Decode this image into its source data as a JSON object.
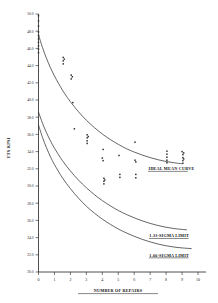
{
  "chart_data": {
    "type": "scatter",
    "title": "",
    "xlabel": "NUMBER OF REPAIRS",
    "ylabel": "UTS KPSI",
    "xlim": [
      0,
      10.5
    ],
    "ylim": [
      20.0,
      50.0
    ],
    "grid": false,
    "legend_position": "inline-annotations",
    "xticks": [
      0,
      1,
      2,
      3,
      4,
      5,
      6,
      7,
      8,
      9,
      10
    ],
    "xtick_labels": [
      "0",
      "1",
      "2",
      "3",
      "4",
      "5",
      "6",
      "7",
      "8",
      "9",
      "10"
    ],
    "yticks": [
      50.0,
      48.0,
      46.0,
      44.0,
      42.0,
      40.0,
      38.0,
      36.0,
      34.0,
      32.0,
      30.0,
      28.0,
      26.0,
      24.0,
      22.0,
      20.0
    ],
    "ytick_labels": [
      "50.0",
      "48.0",
      "46.0",
      "44.0",
      "42.0",
      "40.0",
      "38.0",
      "36.0",
      "34.0",
      "32.0",
      "30.0",
      "28.0",
      "26.0",
      "24.0",
      "22.0",
      "20.0"
    ],
    "series": [
      {
        "name": "IDEAL MEAN CURVE",
        "type": "line",
        "points": [
          [
            0.0,
            47.6
          ],
          [
            0.25,
            46.1
          ],
          [
            0.5,
            44.85
          ],
          [
            0.75,
            43.75
          ],
          [
            1.0,
            42.8
          ],
          [
            1.25,
            41.95
          ],
          [
            1.5,
            41.15
          ],
          [
            1.75,
            40.45
          ],
          [
            2.0,
            39.8
          ],
          [
            2.5,
            38.65
          ],
          [
            3.0,
            37.65
          ],
          [
            3.5,
            36.8
          ],
          [
            4.0,
            36.05
          ],
          [
            4.5,
            35.4
          ],
          [
            5.0,
            34.85
          ],
          [
            5.5,
            34.35
          ],
          [
            6.0,
            33.95
          ],
          [
            6.5,
            33.6
          ],
          [
            7.0,
            33.3
          ],
          [
            7.5,
            33.05
          ],
          [
            8.0,
            32.85
          ],
          [
            8.5,
            32.7
          ],
          [
            9.0,
            32.58
          ]
        ]
      },
      {
        "name": "1.33-SIGMA LIMIT",
        "type": "line",
        "points": [
          [
            0.0,
            38.6
          ],
          [
            0.25,
            37.3
          ],
          [
            0.5,
            36.2
          ],
          [
            0.75,
            35.25
          ],
          [
            1.0,
            34.4
          ],
          [
            1.5,
            32.95
          ],
          [
            2.0,
            31.75
          ],
          [
            2.5,
            30.7
          ],
          [
            3.0,
            29.8
          ],
          [
            3.5,
            29.0
          ],
          [
            4.0,
            28.3
          ],
          [
            4.5,
            27.7
          ],
          [
            5.0,
            27.15
          ],
          [
            5.5,
            26.7
          ],
          [
            6.0,
            26.3
          ],
          [
            6.5,
            25.95
          ],
          [
            7.0,
            25.65
          ],
          [
            7.5,
            25.4
          ],
          [
            8.0,
            25.2
          ],
          [
            8.5,
            25.05
          ],
          [
            9.0,
            24.95
          ],
          [
            9.3,
            24.9
          ]
        ]
      },
      {
        "name": "1.66-SIGMA LIMIT",
        "type": "line",
        "points": [
          [
            0.0,
            37.1
          ],
          [
            0.25,
            35.65
          ],
          [
            0.5,
            34.45
          ],
          [
            0.75,
            33.4
          ],
          [
            1.0,
            32.5
          ],
          [
            1.5,
            30.95
          ],
          [
            2.0,
            29.7
          ],
          [
            2.5,
            28.6
          ],
          [
            3.0,
            27.65
          ],
          [
            3.5,
            26.85
          ],
          [
            4.0,
            26.15
          ],
          [
            4.5,
            25.55
          ],
          [
            5.0,
            25.0
          ],
          [
            5.5,
            24.55
          ],
          [
            6.0,
            24.15
          ],
          [
            6.5,
            23.8
          ],
          [
            7.0,
            23.5
          ],
          [
            7.5,
            23.25
          ],
          [
            8.0,
            23.05
          ],
          [
            8.5,
            22.9
          ],
          [
            9.0,
            22.8
          ],
          [
            9.6,
            22.72
          ]
        ]
      },
      {
        "name": "measured specimens",
        "type": "scatter",
        "points": [
          [
            0.0,
            49.8
          ],
          [
            0.0,
            49.2
          ],
          [
            0.0,
            48.6
          ],
          [
            0.0,
            47.9
          ],
          [
            0.0,
            47.5
          ],
          [
            0.0,
            47.1
          ],
          [
            0.0,
            46.7
          ],
          [
            0.0,
            46.3
          ],
          [
            0.0,
            45.9
          ],
          [
            0.0,
            45.5
          ],
          [
            1.55,
            44.95
          ],
          [
            1.55,
            44.55
          ],
          [
            1.55,
            44.2
          ],
          [
            1.62,
            44.75
          ],
          [
            2.05,
            42.9
          ],
          [
            2.05,
            42.45
          ],
          [
            2.12,
            42.7
          ],
          [
            2.15,
            39.7
          ],
          [
            2.25,
            36.65
          ],
          [
            3.05,
            35.95
          ],
          [
            3.05,
            35.6
          ],
          [
            3.05,
            35.25
          ],
          [
            3.05,
            34.95
          ],
          [
            3.12,
            35.75
          ],
          [
            4.05,
            34.25
          ],
          [
            4.0,
            33.25
          ],
          [
            4.05,
            32.95
          ],
          [
            4.1,
            30.9
          ],
          [
            4.1,
            30.55
          ],
          [
            4.1,
            30.25
          ],
          [
            4.15,
            30.7
          ],
          [
            5.05,
            33.55
          ],
          [
            5.1,
            31.35
          ],
          [
            5.1,
            31.0
          ],
          [
            6.05,
            35.1
          ],
          [
            6.05,
            33.0
          ],
          [
            6.1,
            32.8
          ],
          [
            6.1,
            31.35
          ],
          [
            6.1,
            30.95
          ],
          [
            8.05,
            34.05
          ],
          [
            8.05,
            33.7
          ],
          [
            8.05,
            33.35
          ],
          [
            8.05,
            33.0
          ],
          [
            8.05,
            32.7
          ],
          [
            9.0,
            34.0
          ],
          [
            9.05,
            33.65
          ],
          [
            9.05,
            33.3
          ],
          [
            9.05,
            32.95
          ],
          [
            9.05,
            32.65
          ],
          [
            9.1,
            33.85
          ],
          [
            9.1,
            33.15
          ]
        ]
      }
    ],
    "annotations": [
      {
        "text": "IDEAL MEAN CURVE",
        "x": 6.9,
        "y": 31.85
      },
      {
        "text": "1.33-SIGMA LIMIT",
        "x": 6.95,
        "y": 24.05
      },
      {
        "text": "1.66-SIGMA LIMIT",
        "x": 6.95,
        "y": 21.8
      }
    ]
  },
  "figure": {
    "xlabel": "NUMBER OF REPAIRS",
    "ylabel": "UTS KPSI",
    "annotation_mean": "IDEAL MEAN CURVE",
    "annotation_sigma133": "1.33-SIGMA LIMIT",
    "annotation_sigma166": "1.66-SIGMA LIMIT"
  }
}
